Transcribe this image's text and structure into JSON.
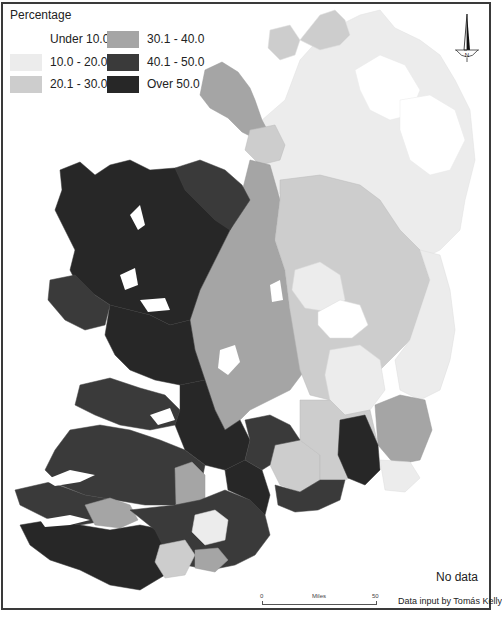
{
  "legend": {
    "title": "Percentage",
    "items": [
      {
        "label": "Under 10.0",
        "color": "#ffffff"
      },
      {
        "label": "10.0 - 20.0",
        "color": "#ececec"
      },
      {
        "label": "20.1 - 30.0",
        "color": "#cdcdcd"
      },
      {
        "label": "30.1 - 40.0",
        "color": "#a5a5a5"
      },
      {
        "label": "40.1 - 50.0",
        "color": "#3a3a3a"
      },
      {
        "label": "Over  50.0",
        "color": "#272727"
      }
    ]
  },
  "north_arrow": {
    "label": "N"
  },
  "no_data": {
    "label": "No data"
  },
  "scale_bar": {
    "start": "0",
    "unit": "Miles",
    "end": "50"
  },
  "credit": "Data input by Tomás Kelly",
  "colors": {
    "frame": "#3a3a3a",
    "background": "#ffffff"
  }
}
